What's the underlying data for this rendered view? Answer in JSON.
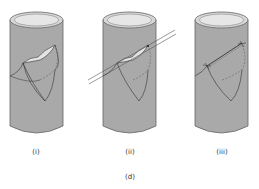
{
  "figure": {
    "label": "(d)",
    "panels": [
      {
        "id": "i",
        "label": "(i)",
        "description": "Cylinder with curved flap/tear on surface"
      },
      {
        "id": "ii",
        "label": "(ii)",
        "description": "Cylinder with parallel lines passing through the flap"
      },
      {
        "id": "iii",
        "label": "(iii)",
        "description": "Cylinder with flap stitched closed along a line"
      }
    ]
  },
  "colors": {
    "cylinder_body": "#a9a9a9",
    "cylinder_top": "#e2e2e2",
    "outline": "#555555",
    "line": "#333333"
  }
}
